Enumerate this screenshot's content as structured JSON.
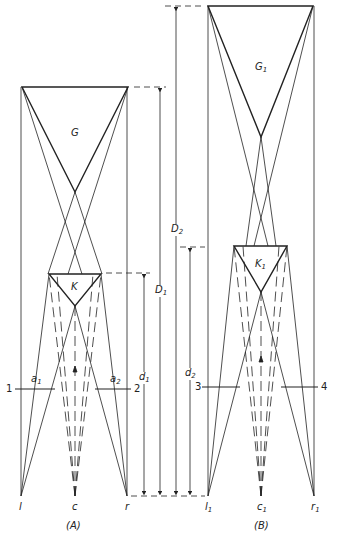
{
  "panels": [
    {
      "caption": "(A)",
      "labels": {
        "large_triangle": "G",
        "small_triangle": "K",
        "left_eye": "l",
        "center": "c",
        "right_eye": "r",
        "plane_left": "1",
        "plane_right": "2",
        "a_left": "a",
        "a_left_sub": "1",
        "a_right": "a",
        "a_right_sub": "2"
      }
    },
    {
      "caption": "(B)",
      "labels": {
        "large_triangle": "G",
        "large_triangle_sub": "1",
        "small_triangle": "K",
        "small_triangle_sub": "1",
        "left_eye": "l",
        "left_eye_sub": "1",
        "center": "c",
        "center_sub": "1",
        "right_eye": "r",
        "right_eye_sub": "1",
        "plane_left": "3",
        "plane_right": "4"
      }
    }
  ],
  "dimensions": {
    "d1": {
      "symbol": "d",
      "sub": "1"
    },
    "D1": {
      "symbol": "D",
      "sub": "1"
    },
    "D2": {
      "symbol": "D",
      "sub": "2"
    },
    "d2": {
      "symbol": "d",
      "sub": "2"
    }
  },
  "colors": {
    "ink": "#222222",
    "background": "#ffffff"
  }
}
